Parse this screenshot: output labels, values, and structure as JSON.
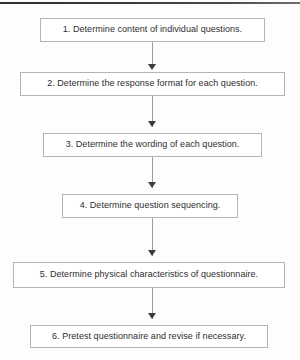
{
  "diagram": {
    "orientation": "vertical",
    "background_color": "#fdfdfd",
    "box_fill": "#ffffff",
    "box_border_color": "#b4b4b4",
    "text_color": "#2e2e2e",
    "connector_color": "#9a9a9a",
    "arrowhead_color": "#3d3d3d",
    "top_rule_color": "#3a3a3a",
    "steps": [
      {
        "number": "1",
        "label": "1. Determine content of individual questions.",
        "x": 40,
        "y": 18,
        "width": 225,
        "height": 24
      },
      {
        "number": "2",
        "label": "2. Determine the response format for each question.",
        "x": 20,
        "y": 72,
        "width": 265,
        "height": 24
      },
      {
        "number": "3",
        "label": "3. Determine the wording of each question.",
        "x": 43,
        "y": 133,
        "width": 219,
        "height": 24
      },
      {
        "number": "4",
        "label": "4. Determine question sequencing.",
        "x": 62,
        "y": 194,
        "width": 176,
        "height": 24
      },
      {
        "number": "5",
        "label": "5. Determine physical characteristics of questionnaire.",
        "x": 13,
        "y": 262,
        "width": 272,
        "height": 26
      },
      {
        "number": "6",
        "label": "6. Pretest questionnaire and revise if necessary.",
        "x": 30,
        "y": 325,
        "width": 238,
        "height": 23
      }
    ],
    "connectors": [
      {
        "from": "1",
        "to": "2",
        "top": 42,
        "height": 22,
        "arrow_y": 64
      },
      {
        "from": "2",
        "to": "3",
        "top": 96,
        "height": 31,
        "arrow_y": 121
      },
      {
        "from": "3",
        "to": "4",
        "top": 157,
        "height": 31,
        "arrow_y": 182
      },
      {
        "from": "4",
        "to": "5",
        "top": 218,
        "height": 38,
        "arrow_y": 250
      },
      {
        "from": "5",
        "to": "6",
        "top": 288,
        "height": 31,
        "arrow_y": 313
      }
    ]
  }
}
